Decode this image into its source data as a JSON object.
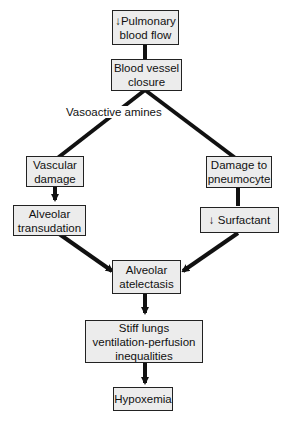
{
  "nodes": {
    "pulmonary_flow": {
      "label": "↓Pulmonary\nblood flow"
    },
    "vessel_closure": {
      "label": "Blood vessel\nclosure"
    },
    "vascular_damage": {
      "label": "Vascular\ndamage"
    },
    "alveolar_transudation": {
      "label": "Alveolar\ntransudation"
    },
    "pneumocyte_damage": {
      "label": "Damage to\npneumocyte"
    },
    "surfactant": {
      "label": "↓ Surfactant"
    },
    "atelectasis": {
      "label": "Alveolar\natelectasis"
    },
    "stiff_lungs": {
      "label": "Stiff lungs\nventilation-perfusion\ninequalities"
    },
    "hypoxemia": {
      "label": "Hypoxemia"
    }
  },
  "edge_labels": {
    "vasoactive": "Vasoactive amines"
  },
  "colors": {
    "box_fill": "#ececec",
    "line": "#111111"
  }
}
